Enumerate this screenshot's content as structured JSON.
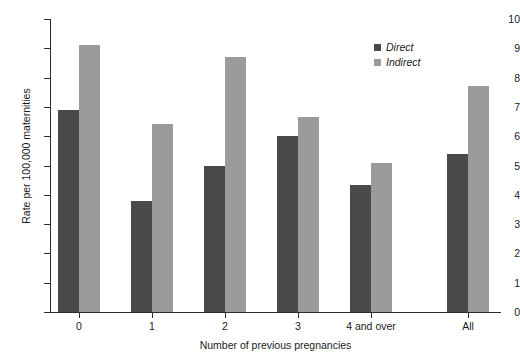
{
  "chart_data": {
    "type": "bar",
    "title": "",
    "xlabel": "Number of previous pregnancies",
    "ylabel": "Rate per 100,000 maternities",
    "categories": [
      "0",
      "1",
      "2",
      "3",
      "4 and over",
      "All"
    ],
    "series": [
      {
        "name": "Direct",
        "color": "#4a4a4a",
        "values": [
          6.9,
          3.8,
          5.0,
          6.0,
          4.35,
          5.4
        ]
      },
      {
        "name": "Indirect",
        "color": "#9b9b9b",
        "values": [
          9.1,
          6.4,
          8.7,
          6.65,
          5.1,
          7.7
        ]
      }
    ],
    "ylim": [
      0,
      10
    ],
    "yticks": [
      "0",
      "1",
      "2",
      "3",
      "4",
      "5",
      "6",
      "7",
      "8",
      "9",
      "10"
    ],
    "grid": false,
    "legend_position": "top-right",
    "legend_entries": [
      "Direct",
      "Indirect"
    ]
  },
  "axes": {
    "y_title": "Rate per 100,000 maternities",
    "x_title": "Number of previous pregnancies"
  },
  "legend": {
    "items": [
      {
        "label": "Direct"
      },
      {
        "label": "Indirect"
      }
    ]
  }
}
